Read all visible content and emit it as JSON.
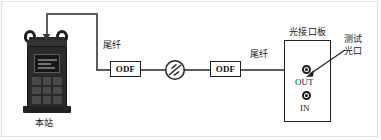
{
  "diagram": {
    "type": "fiber-optic-test-setup",
    "instrument": {
      "name": "handheld-optical-tester",
      "station_label": "本站"
    },
    "labels": {
      "pigtail_left": "尾纤",
      "pigtail_right": "尾纤",
      "interface_board": "光接口板",
      "test_port_line1": "测试",
      "test_port_line2": "光口"
    },
    "odf_left": {
      "label": "ODF"
    },
    "odf_right": {
      "label": "ODF"
    },
    "attenuator": {
      "name": "optical-attenuator",
      "symbol": "circle-with-diagonal-strokes"
    },
    "interface_board": {
      "ports": [
        {
          "label": "OUT",
          "name": "out-port"
        },
        {
          "label": "IN",
          "name": "in-port"
        }
      ]
    },
    "colors": {
      "wire": "#5b5b5b",
      "outline": "#1f1f1f",
      "text": "#1a1a1a",
      "instrument_body": "#2b2b2b",
      "background": "#fdfdfd"
    }
  }
}
